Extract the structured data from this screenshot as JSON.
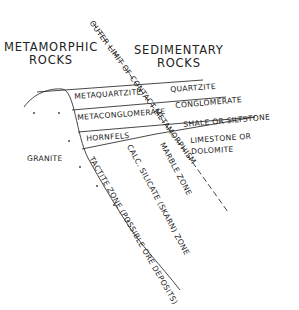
{
  "title_left": {
    "line1": "METAMORPHIC",
    "line2": "ROCKS"
  },
  "title_right": {
    "line1": "SEDIMENTARY",
    "line2": "ROCKS"
  },
  "contact_line_label": "OUTER LIMIT OF CONTACT METAMORPHISM",
  "metamorphic_layers": [
    "METAQUARTZITE",
    "METACONGLOMERATE",
    "HORNFELS"
  ],
  "sedimentary_layers": [
    "QUARTZITE",
    "CONGLOMERATE",
    "SHALE OR SILTSTONE",
    "LIMESTONE OR",
    "DOLOMITE"
  ],
  "intrusion_label": "GRANITE",
  "zones": {
    "marble": "MARBLE ZONE",
    "calc_silicate": "CALC. SILICATE (SKARN) ZONE",
    "tactite": "TACTITE ZONE (POSSIBLE ORE DEPOSITS)"
  },
  "colors": {
    "ink": "#222222",
    "background": "#ffffff"
  }
}
